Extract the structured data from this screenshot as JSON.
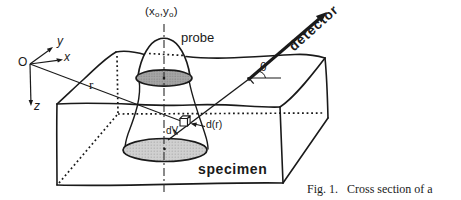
{
  "figure": {
    "labels": {
      "coords_prefix": "(x",
      "coords_sub1": "o",
      "coords_mid": ",y",
      "coords_sub2": "o",
      "coords_suffix": ")",
      "probe": "probe",
      "detector": "detector",
      "theta": "θ",
      "r": "r",
      "origin": "O",
      "axis_x": "x",
      "axis_y": "y",
      "axis_z": "z",
      "dV": "dV",
      "d_of_r": "d(r)",
      "specimen": "specimen"
    },
    "caption": {
      "line1": "Fig. 1.   Cross section of a",
      "line2": "beam-specimen interaction"
    },
    "colors": {
      "line": "#1a1a1a",
      "entry_spot_fill": "#a6a6a6",
      "entry_spot_dot": "#787878",
      "interaction_base_fill": "#d0d0d0",
      "interaction_base_dot": "#a8a8a8",
      "background": "#ffffff"
    }
  }
}
